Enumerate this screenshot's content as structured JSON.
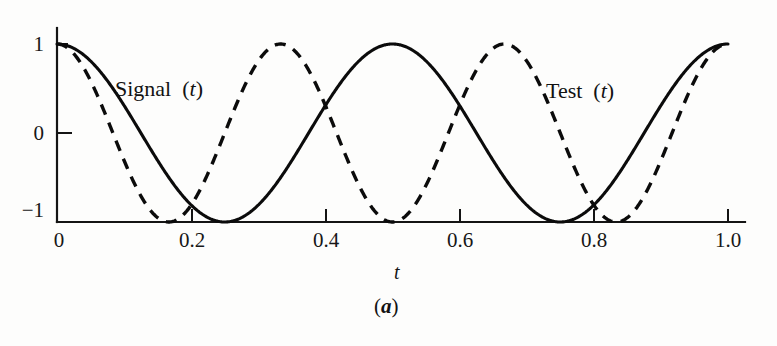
{
  "figure": {
    "caption": "(a)",
    "caption_letter": "a",
    "background_color": "#fdfdfc",
    "ink_color": "#0b0b0b"
  },
  "chart_data": {
    "type": "line",
    "title": "",
    "subtitle": "",
    "xlabel": "t",
    "ylabel": "",
    "xlim": [
      0,
      1.0
    ],
    "ylim": [
      -1,
      1
    ],
    "grid": false,
    "legend_position": "inline-annotation",
    "x_ticks": [
      0,
      0.2,
      0.4,
      0.6,
      0.8,
      1.0
    ],
    "x_tick_labels": [
      "0",
      "0.2",
      "0.4",
      "0.6",
      "0.8",
      "1.0"
    ],
    "y_ticks": [
      1,
      0,
      -1
    ],
    "y_tick_labels": [
      "1",
      "0",
      "−1"
    ],
    "series": [
      {
        "name": "Signal (t)",
        "label_text": "Signal",
        "label_arg": "(t)",
        "style": "solid",
        "formula": "cos(2*pi*2*t)",
        "frequency_cycles": 2,
        "amplitude": 1,
        "phase": 0,
        "color": "#0b0b0b",
        "x": [
          0,
          0.05,
          0.1,
          0.125,
          0.15,
          0.2,
          0.25,
          0.3,
          0.35,
          0.375,
          0.4,
          0.45,
          0.5,
          0.55,
          0.6,
          0.625,
          0.65,
          0.7,
          0.75,
          0.8,
          0.85,
          0.875,
          0.9,
          0.95,
          1.0
        ],
        "values": [
          1,
          0.809,
          0.309,
          0,
          -0.309,
          -0.809,
          -1,
          -0.809,
          -0.309,
          0,
          0.309,
          0.809,
          1,
          0.809,
          0.309,
          0,
          -0.309,
          -0.809,
          -1,
          -0.809,
          -0.309,
          0,
          0.309,
          0.809,
          1
        ]
      },
      {
        "name": "Test (t)",
        "label_text": "Test",
        "label_arg": "(t)",
        "style": "dashed",
        "formula": "cos(2*pi*3*t)",
        "frequency_cycles": 3,
        "amplitude": 1,
        "phase": 0,
        "color": "#0b0b0b",
        "x": [
          0,
          0.0417,
          0.0833,
          0.125,
          0.1667,
          0.2083,
          0.25,
          0.2917,
          0.3333,
          0.375,
          0.4167,
          0.4583,
          0.5,
          0.5417,
          0.5833,
          0.625,
          0.6667,
          0.7083,
          0.75,
          0.7917,
          0.8333,
          0.875,
          0.9167,
          0.9583,
          1.0
        ],
        "values": [
          1,
          0.707,
          0,
          -0.707,
          -1,
          -0.707,
          0,
          0.707,
          1,
          0.707,
          0,
          -0.707,
          -1,
          -0.707,
          0,
          0.707,
          1,
          0.707,
          0,
          -0.707,
          -1,
          -0.707,
          0,
          0.707,
          1
        ]
      }
    ],
    "annotations": [
      {
        "text": "Signal (t)",
        "x": 0.09,
        "y": 0.62
      },
      {
        "text": "Test (t)",
        "x": 0.73,
        "y": 0.58
      }
    ]
  }
}
